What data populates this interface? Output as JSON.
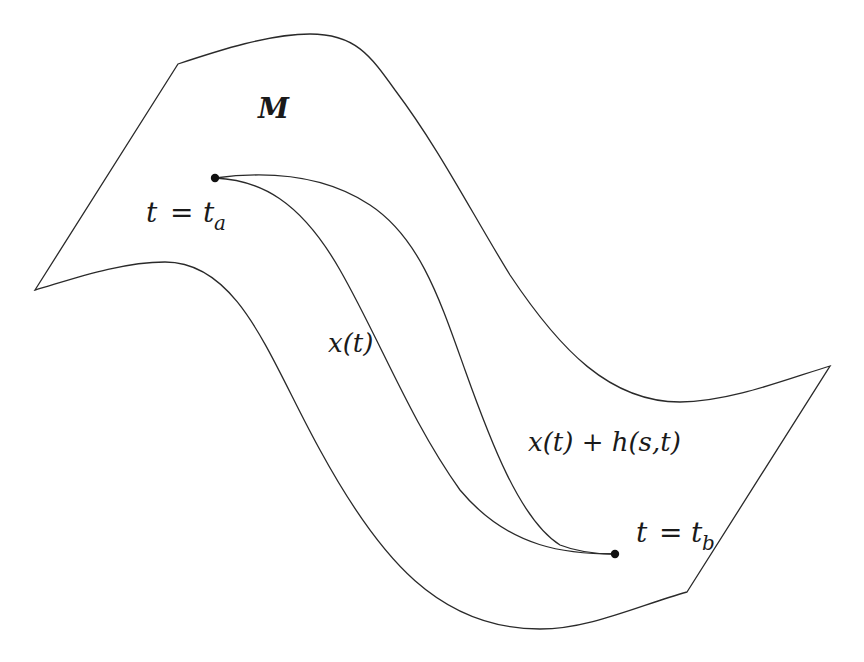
{
  "diagram": {
    "type": "manifold-path-variation",
    "colors": {
      "stroke": "#2a2a2a",
      "background": "#ffffff",
      "text": "#1a1a1a"
    },
    "manifold": {
      "label": "M"
    },
    "start_point": {
      "var": "t",
      "eq": "=",
      "base": "t",
      "subscript": "a"
    },
    "end_point": {
      "var": "t",
      "eq": "=",
      "base": "t",
      "subscript": "b"
    },
    "path_label": {
      "text": "x(t)"
    },
    "varied_path_label": {
      "text": "x(t) + h(s,t)"
    }
  }
}
